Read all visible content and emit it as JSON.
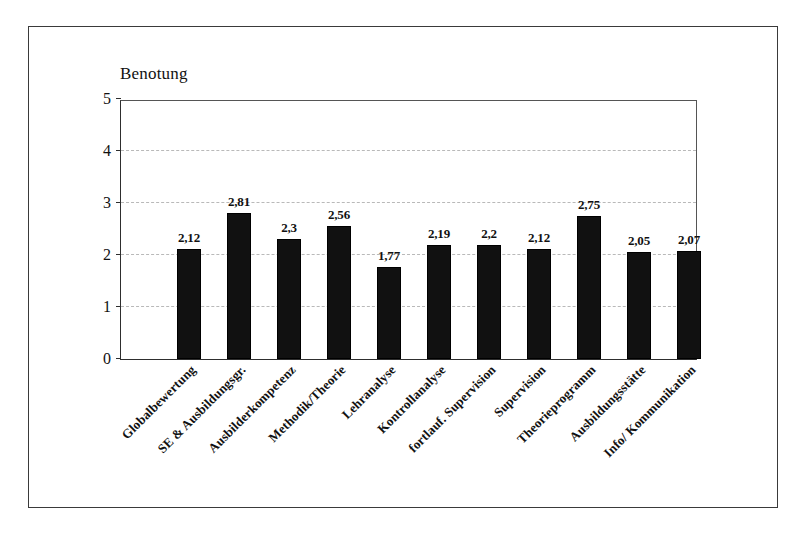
{
  "chart_data": {
    "type": "bar",
    "title": "",
    "ylabel": "Benotung",
    "xlabel": "",
    "ylim": [
      0,
      5
    ],
    "yticks": [
      0,
      1,
      2,
      3,
      4,
      5
    ],
    "ytick_labels": [
      "0",
      "1",
      "2",
      "3",
      "4",
      "5"
    ],
    "gridlines": [
      1,
      2,
      3,
      4
    ],
    "grid": true,
    "legend": "none",
    "bar_color": "#111111",
    "categories": [
      "Globalbewertung",
      "SE & Ausbildungsgr.",
      "Ausbilderkompetenz",
      "Methodik/Theorie",
      "Lehranalyse",
      "Kontrollanalyse",
      "fortlauf. Supervision",
      "Supervision",
      "Theorieprogramm",
      "Ausbildungsstätte",
      "Info/ Kommunikation"
    ],
    "values": [
      2.12,
      2.81,
      2.3,
      2.56,
      1.77,
      2.19,
      2.2,
      2.12,
      2.75,
      2.05,
      2.07
    ],
    "value_labels": [
      "2,12",
      "2,81",
      "2,3",
      "2,56",
      "1,77",
      "2,19",
      "2,2",
      "2,12",
      "2,75",
      "2,05",
      "2,07"
    ]
  },
  "figure": {
    "frame_color": "#3a3a3a",
    "background": "#ffffff",
    "gridline_color": "#b9b9b9",
    "axis_color": "#2e2e2e"
  }
}
